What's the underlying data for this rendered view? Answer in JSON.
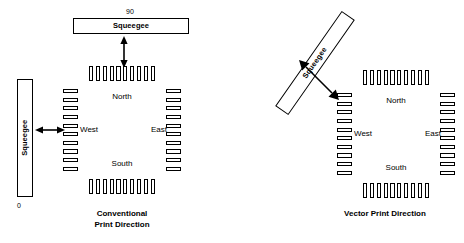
{
  "diagram": {
    "line_color": "#000000",
    "fill_color": "#ffffff"
  },
  "panels": [
    {
      "id": "conventional",
      "caption_line1": "Conventional",
      "caption_line2": "Print Direction",
      "squeegees": [
        {
          "id": "top",
          "label": "Squeegee",
          "orientation": "horizontal",
          "angle_deg": 0,
          "tick_label": "90"
        },
        {
          "id": "left",
          "label": "Squeegee",
          "orientation": "vertical",
          "angle_deg": 90,
          "tick_label": "0"
        }
      ],
      "arrows": [
        {
          "id": "vertical",
          "direction": "double-vertical"
        },
        {
          "id": "horizontal",
          "direction": "double-horizontal"
        }
      ],
      "chip": {
        "compass": {
          "north": "North",
          "south": "South",
          "west": "West",
          "east": "East"
        },
        "pads_per_side": 10
      }
    },
    {
      "id": "vector",
      "caption_line1": "Vector Print Direction",
      "caption_line2": "",
      "squeegees": [
        {
          "id": "diagonal",
          "label": "Squeegee",
          "orientation": "diagonal",
          "angle_deg": -55,
          "tick_label": ""
        }
      ],
      "arrows": [
        {
          "id": "diagonal",
          "direction": "double-diagonal"
        }
      ],
      "chip": {
        "compass": {
          "north": "North",
          "south": "South",
          "west": "West",
          "east": "East"
        },
        "pads_per_side": 10
      }
    }
  ]
}
